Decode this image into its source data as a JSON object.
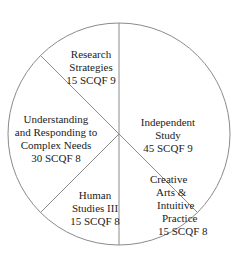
{
  "chart_data": {
    "type": "pie",
    "title": "",
    "total": 120,
    "start_angle_deg": 0,
    "direction": "clockwise",
    "slices": [
      {
        "name": "Independent Study",
        "value": 45,
        "level": "SCQF 9",
        "label_lines": [
          "Independent",
          "Study",
          "45 SCQF 9"
        ]
      },
      {
        "name": "Creative Arts & Intuitive Practice",
        "value": 15,
        "level": "SCQF 8",
        "label_lines": [
          "Creative",
          "Arts &",
          "Intuitive",
          "Practice",
          "15 SCQF 8"
        ]
      },
      {
        "name": "Human Studies III",
        "value": 15,
        "level": "SCQF 8",
        "label_lines": [
          "Human",
          "Studies III",
          "15 SCQF 8"
        ]
      },
      {
        "name": "Understanding and Responding to Complex Needs",
        "value": 30,
        "level": "SCQF 8",
        "label_lines": [
          "Understanding",
          "and Responding to",
          "Complex Needs",
          "30 SCQF 8"
        ]
      },
      {
        "name": "Research Strategies",
        "value": 15,
        "level": "SCQF 9",
        "label_lines": [
          "Research",
          "Strategies",
          "15 SCQF 9"
        ]
      }
    ],
    "colors": {
      "fill": "#ffffff",
      "stroke": "#8a8a8a",
      "text": "#222222"
    }
  }
}
